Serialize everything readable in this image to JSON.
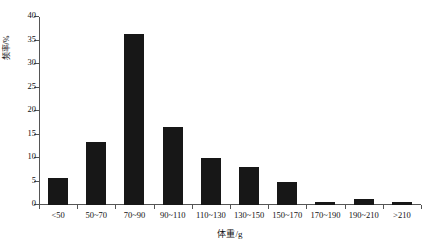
{
  "chart_data": {
    "type": "bar",
    "title": "",
    "xlabel": "体重/g",
    "ylabel": "频率/%",
    "categories": [
      "<50",
      "50~70",
      "70~90",
      "90~110",
      "110~130",
      "130~150",
      "150~170",
      "170~190",
      "190~210",
      ">210"
    ],
    "values": [
      5.7,
      13.4,
      36.3,
      16.7,
      10.0,
      8.1,
      4.8,
      0.7,
      1.2,
      0.6
    ],
    "ylim": [
      0,
      40
    ],
    "ytick_labels": [
      "0",
      "5",
      "10",
      "15",
      "20",
      "25",
      "30",
      "35",
      "40"
    ],
    "ytick_values": [
      0,
      5,
      10,
      15,
      20,
      25,
      30,
      35,
      40
    ],
    "grid": false,
    "legend": null,
    "bar_color": "#171717",
    "axis_color": "#555555"
  }
}
